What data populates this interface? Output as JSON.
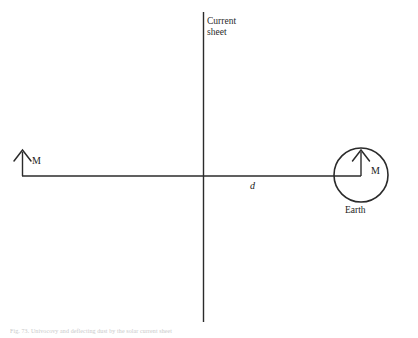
{
  "figure": {
    "domain": "physics-diagram",
    "background_color": "#ffffff",
    "stroke_color": "#2b2b2b",
    "width": 418,
    "height": 338
  },
  "labels": {
    "current_sheet": "Current\nsheet",
    "magnetic_moment_left": "M",
    "magnetic_moment_earth": "M",
    "distance": "d",
    "earth": "Earth"
  },
  "caption": {
    "figure_number": "Fig. 73.",
    "text": "Fig. 73.  Univocovy and deflecting dust by the solar current sheet"
  },
  "elements": {
    "current_sheet_line": {
      "name": "current-sheet",
      "orientation": "vertical",
      "x": 203,
      "y_top": 12,
      "y_bottom": 322
    },
    "separation_line": {
      "name": "separation-distance-line",
      "orientation": "horizontal",
      "y": 176,
      "x_left": 22,
      "x_right": 361
    },
    "earth_circle": {
      "name": "earth",
      "center_x": 361,
      "center_y": 175,
      "radius": 27
    },
    "left_moment_arrow": {
      "name": "moment-arrow-left",
      "x": 22,
      "y_base": 176,
      "y_tip": 151,
      "direction": "up"
    },
    "earth_moment_arrow": {
      "name": "moment-arrow-earth",
      "x": 361,
      "y_base": 176,
      "y_tip": 151,
      "direction": "up"
    }
  }
}
